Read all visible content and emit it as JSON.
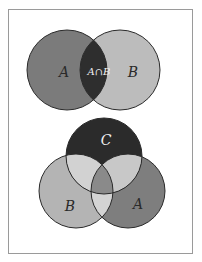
{
  "top_diagram": {
    "label_a": "A",
    "label_b": "B",
    "label_intersection": "A∩B",
    "colors": {
      "a": "#7b7b7b",
      "b": "#bcbcbc",
      "intersection": "#2e2e2e",
      "stroke": "#2a2a2a"
    }
  },
  "bottom_diagram": {
    "label_c": "C",
    "label_b": "B",
    "label_a": "A",
    "colors": {
      "c": "#2b2b2b",
      "b": "#b4b4b4",
      "a": "#7e7e7e",
      "bc": "#d2d2d2",
      "ac": "#c8c8c8",
      "ab": "#d4d4d4",
      "abc": "#8a8a8a",
      "stroke": "#2a2a2a"
    }
  }
}
